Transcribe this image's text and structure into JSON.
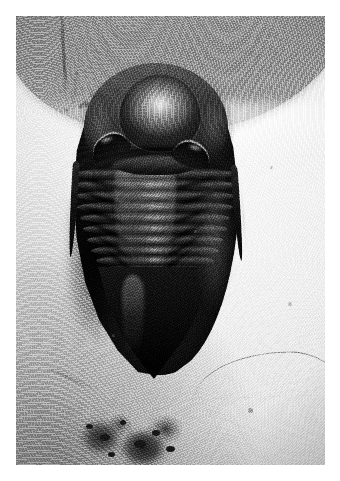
{
  "image": {
    "kind": "photograph",
    "color_mode": "black-and-white",
    "subject": "trilobite fossil",
    "caption": "",
    "border": {
      "present": true,
      "color": "#ffffff",
      "width_px": 16
    },
    "canvas": {
      "width_px": 340,
      "height_px": 481
    },
    "photo_area": {
      "x": 16,
      "y": 16,
      "width_px": 309,
      "height_px": 449
    }
  },
  "palette": {
    "border_white": "#ffffff",
    "matrix_highlight": "#f2f0ec",
    "matrix_light": "#dedbd4",
    "matrix_mid": "#b7b4ad",
    "top_slab_gray": "#8d8b88",
    "carapace_mid": "#443f3a",
    "carapace_dark": "#1b1916",
    "carapace_black": "#0b0a0a",
    "specular_highlight": "#c9c5bd",
    "debris_dark": "#242220"
  },
  "scene": {
    "background_label": "grainy pale limestone / sandstone matrix",
    "top_region_label": "shadowed gray rock slab across upper edge",
    "lighting": "directional light from upper right, shadow falling to lower left",
    "bottom_detail_label": "dark irregular debris and lichen patch",
    "thin_line_label": "fine diagonal scratch or hair across lower right matrix"
  },
  "specimen": {
    "name": "trilobite",
    "orientation": "dorsal view, head at top, tail at bottom",
    "bounds": {
      "left_px": 56,
      "top_px": 51,
      "width_px": 186,
      "height_px": 320
    },
    "parts": [
      {
        "id": "cephalon",
        "label": "cephalon (head shield)"
      },
      {
        "id": "glabella",
        "label": "glabella (central head lobe)"
      },
      {
        "id": "eye-left",
        "label": "left compound eye"
      },
      {
        "id": "eye-right",
        "label": "right compound eye"
      },
      {
        "id": "cheek-left",
        "label": "left free cheek"
      },
      {
        "id": "cheek-right",
        "label": "right free cheek"
      },
      {
        "id": "genal-spine-left",
        "label": "left genal spine"
      },
      {
        "id": "genal-spine-right",
        "label": "right genal spine"
      },
      {
        "id": "thorax",
        "label": "thorax (articulated segments)"
      },
      {
        "id": "axial-lobe",
        "label": "axial lobe ridge"
      },
      {
        "id": "pygidium",
        "label": "pygidium (tail shield)"
      }
    ],
    "thorax_segment_count": 11,
    "segments": [
      {
        "index": 1,
        "top_px": 2,
        "height_px": 14,
        "inset_px": 2
      },
      {
        "index": 2,
        "top_px": 13,
        "height_px": 14,
        "inset_px": 3
      },
      {
        "index": 3,
        "top_px": 24,
        "height_px": 14,
        "inset_px": 5
      },
      {
        "index": 4,
        "top_px": 35,
        "height_px": 14,
        "inset_px": 7
      },
      {
        "index": 5,
        "top_px": 46,
        "height_px": 14,
        "inset_px": 10
      },
      {
        "index": 6,
        "top_px": 57,
        "height_px": 14,
        "inset_px": 13
      },
      {
        "index": 7,
        "top_px": 68,
        "height_px": 14,
        "inset_px": 17
      },
      {
        "index": 8,
        "top_px": 79,
        "height_px": 13,
        "inset_px": 21
      },
      {
        "index": 9,
        "top_px": 89,
        "height_px": 13,
        "inset_px": 26
      },
      {
        "index": 10,
        "top_px": 99,
        "height_px": 12,
        "inset_px": 32
      },
      {
        "index": 11,
        "top_px": 108,
        "height_px": 12,
        "inset_px": 38
      }
    ],
    "pleural_furrows": [
      {
        "left_px": 14,
        "top_px": 120,
        "rotate_deg": 16
      },
      {
        "left_px": 14,
        "top_px": 136,
        "rotate_deg": 19
      },
      {
        "left_px": 16,
        "top_px": 152,
        "rotate_deg": 23
      },
      {
        "left_px": 20,
        "top_px": 168,
        "rotate_deg": 27
      },
      {
        "left_px": 26,
        "top_px": 184,
        "rotate_deg": 32
      },
      {
        "left_px": 34,
        "top_px": 199,
        "rotate_deg": 38
      },
      {
        "left_px": 106,
        "top_px": 120,
        "rotate_deg": -16
      },
      {
        "left_px": 106,
        "top_px": 136,
        "rotate_deg": -19
      },
      {
        "left_px": 104,
        "top_px": 152,
        "rotate_deg": -23
      },
      {
        "left_px": 100,
        "top_px": 168,
        "rotate_deg": -27
      },
      {
        "left_px": 94,
        "top_px": 184,
        "rotate_deg": -32
      },
      {
        "left_px": 86,
        "top_px": 199,
        "rotate_deg": -38
      }
    ]
  },
  "matrix_marks": {
    "pits": [
      {
        "left_px": 48,
        "top_px": 92,
        "size_px": 4,
        "color": "#57544f",
        "opacity": 0.55
      },
      {
        "left_px": 178,
        "top_px": 214,
        "size_px": 3,
        "color": "#6a6762",
        "opacity": 0.45
      },
      {
        "left_px": 254,
        "top_px": 150,
        "size_px": 3,
        "color": "#74716c",
        "opacity": 0.4
      },
      {
        "left_px": 272,
        "top_px": 286,
        "size_px": 4,
        "color": "#6e6b66",
        "opacity": 0.42
      },
      {
        "left_px": 40,
        "top_px": 258,
        "size_px": 3,
        "color": "#807d78",
        "opacity": 0.35
      },
      {
        "left_px": 232,
        "top_px": 392,
        "size_px": 5,
        "color": "#5d5a55",
        "opacity": 0.5
      },
      {
        "left_px": 96,
        "top_px": 318,
        "size_px": 3,
        "color": "#6b6863",
        "opacity": 0.38
      }
    ],
    "debris_specks": [
      {
        "left_px": 70,
        "top_px": 408,
        "w_px": 7,
        "h_px": 5
      },
      {
        "left_px": 84,
        "top_px": 418,
        "w_px": 10,
        "h_px": 7
      },
      {
        "left_px": 104,
        "top_px": 404,
        "w_px": 6,
        "h_px": 5
      },
      {
        "left_px": 118,
        "top_px": 424,
        "w_px": 12,
        "h_px": 8
      },
      {
        "left_px": 136,
        "top_px": 414,
        "w_px": 8,
        "h_px": 6
      },
      {
        "left_px": 150,
        "top_px": 430,
        "w_px": 9,
        "h_px": 6
      },
      {
        "left_px": 92,
        "top_px": 436,
        "w_px": 7,
        "h_px": 5
      }
    ]
  }
}
